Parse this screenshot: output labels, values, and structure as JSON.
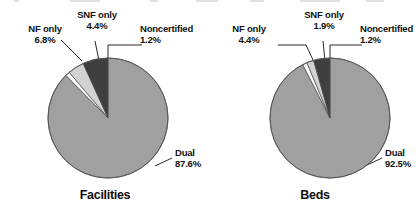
{
  "figure": {
    "background_color": "#ffffff",
    "text_color": "#111111"
  },
  "chart_data": [
    {
      "type": "pie",
      "title": "Facilities",
      "xlabel": "",
      "ylabel": "",
      "legend_position": "callout-labels",
      "grid": false,
      "start_angle_deg": 0,
      "direction": "clockwise",
      "categories": [
        "Dual",
        "Noncertified",
        "SNF only",
        "NF only"
      ],
      "values": [
        87.6,
        1.2,
        4.4,
        6.8
      ],
      "value_labels": [
        "87.6%",
        "1.2%",
        "4.4%",
        "6.8%"
      ],
      "colors": [
        "#a0a0a0",
        "#ffffff",
        "#d2d2d2",
        "#3f3f3f"
      ],
      "slices": [
        {
          "name": "Dual",
          "value": 87.6,
          "value_label": "87.6%",
          "color": "#a0a0a0"
        },
        {
          "name": "Noncertified",
          "value": 1.2,
          "value_label": "1.2%",
          "color": "#ffffff"
        },
        {
          "name": "SNF only",
          "value": 4.4,
          "value_label": "4.4%",
          "color": "#d2d2d2"
        },
        {
          "name": "NF only",
          "value": 6.8,
          "value_label": "6.8%",
          "color": "#3f3f3f"
        }
      ]
    },
    {
      "type": "pie",
      "title": "Beds",
      "xlabel": "",
      "ylabel": "",
      "legend_position": "callout-labels",
      "grid": false,
      "start_angle_deg": 0,
      "direction": "clockwise",
      "categories": [
        "Dual",
        "Noncertified",
        "SNF only",
        "NF only"
      ],
      "values": [
        92.5,
        1.2,
        1.9,
        4.4
      ],
      "value_labels": [
        "92.5%",
        "1.2%",
        "1.9%",
        "4.4%"
      ],
      "colors": [
        "#a0a0a0",
        "#ffffff",
        "#d2d2d2",
        "#3f3f3f"
      ],
      "slices": [
        {
          "name": "Dual",
          "value": 92.5,
          "value_label": "92.5%",
          "color": "#a0a0a0"
        },
        {
          "name": "Noncertified",
          "value": 1.2,
          "value_label": "1.2%",
          "color": "#ffffff"
        },
        {
          "name": "SNF only",
          "value": 1.9,
          "value_label": "1.9%",
          "color": "#d2d2d2"
        },
        {
          "name": "NF only",
          "value": 4.4,
          "value_label": "4.4%",
          "color": "#3f3f3f"
        }
      ]
    }
  ],
  "facilities": {
    "title": "Facilities",
    "callouts": {
      "nf_only": {
        "label": "NF only",
        "value": "6.8%"
      },
      "snf_only": {
        "label": "SNF only",
        "value": "4.4%"
      },
      "noncertified": {
        "label": "Noncertified",
        "value": "1.2%"
      },
      "dual": {
        "label": "Dual",
        "value": "87.6%"
      }
    }
  },
  "beds": {
    "title": "Beds",
    "callouts": {
      "nf_only": {
        "label": "NF only",
        "value": "4.4%"
      },
      "snf_only": {
        "label": "SNF only",
        "value": "1.9%"
      },
      "noncertified": {
        "label": "Noncertified",
        "value": "1.2%"
      },
      "dual": {
        "label": "Dual",
        "value": "92.5%"
      }
    }
  }
}
